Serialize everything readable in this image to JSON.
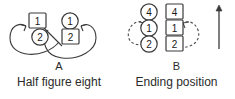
{
  "figure": {
    "background_color": "#ffffff",
    "stroke_color": "#3a3a3a",
    "text_color": "#2b2b2b"
  },
  "panels": [
    {
      "id": "A",
      "letter": "A",
      "caption": "Half figure eight",
      "nodes": [
        {
          "label": "1",
          "shape": "square",
          "position": "upper-left"
        },
        {
          "label": "1",
          "shape": "circle",
          "position": "upper-right"
        },
        {
          "label": "2",
          "shape": "circle",
          "position": "lower-left"
        },
        {
          "label": "2",
          "shape": "square",
          "position": "lower-right"
        }
      ],
      "path_type": "figure-eight",
      "arrow_count": 2,
      "arrow_direction": "inward-up"
    },
    {
      "id": "B",
      "letter": "B",
      "caption": "Ending position",
      "columns": [
        {
          "name": "circle-column",
          "shape": "circle",
          "labels": [
            "4",
            "1",
            "2"
          ]
        },
        {
          "name": "square-column",
          "shape": "square",
          "labels": [
            "4",
            "1",
            "2"
          ]
        }
      ],
      "path_type": "dashed-loops",
      "arrow_count": 2,
      "arrow_direction": "inward-up"
    }
  ],
  "side_arrow": {
    "name": "up-arrow",
    "direction": "up"
  }
}
